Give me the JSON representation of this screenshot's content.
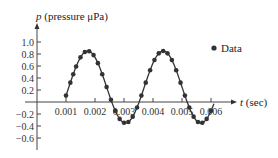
{
  "chart_data": {
    "type": "scatter",
    "title": "",
    "xlabel": "t (sec)",
    "ylabel": "p (pressure μPa)",
    "x_ticks": [
      "0.001",
      "0.002",
      "0.003",
      "0.004",
      "0.005",
      "0.006"
    ],
    "y_ticks": [
      "1.0",
      "0.8",
      "0.6",
      "0.4",
      "0.2",
      "−0.2",
      "−0.4",
      "−0.6"
    ],
    "xlim": [
      0,
      0.0068
    ],
    "ylim": [
      -0.8,
      1.2
    ],
    "grid": false,
    "legend": {
      "position": "upper right",
      "entries": [
        "Data"
      ]
    },
    "series": [
      {
        "name": "Data",
        "style": "points",
        "x": [
          0.001,
          0.00115,
          0.00125,
          0.00135,
          0.0015,
          0.00165,
          0.0018,
          0.00195,
          0.0021,
          0.00225,
          0.0024,
          0.00255,
          0.0027,
          0.00285,
          0.003,
          0.00315,
          0.0033,
          0.00345,
          0.0036,
          0.00375,
          0.0039,
          0.00405,
          0.0042,
          0.00435,
          0.0045,
          0.00465,
          0.0048,
          0.00495,
          0.0051,
          0.00525,
          0.0054,
          0.00555,
          0.0057,
          0.00585,
          0.006
        ],
        "y": [
          -0.1,
          0.2,
          0.45,
          0.67,
          0.8,
          0.85,
          0.84,
          0.78,
          0.6,
          0.4,
          0.12,
          -0.1,
          -0.25,
          -0.33,
          -0.35,
          -0.25,
          -0.05,
          0.1,
          0.38,
          0.6,
          0.74,
          0.84,
          0.85,
          0.8,
          0.65,
          0.45,
          0.25,
          0.05,
          -0.15,
          -0.3,
          -0.35,
          -0.33,
          -0.25,
          -0.1,
          0.05
        ]
      },
      {
        "name": "Model",
        "style": "line",
        "model": "p = 0.6 sin(2π t / 0.0026 + φ) + 0.25",
        "x_range": [
          0.00098,
          0.0061
        ]
      }
    ]
  },
  "labels": {
    "y_axis": "p (pressure μPa)",
    "x_axis": "t (sec)",
    "legend_data": "Data"
  }
}
